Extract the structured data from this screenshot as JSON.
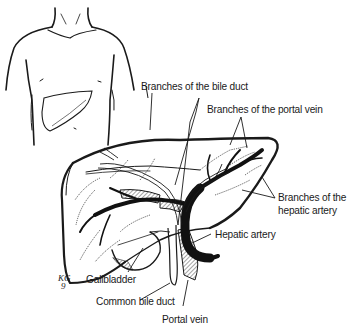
{
  "diagram": {
    "colors": {
      "ink": "#1a1a1a",
      "background": "#ffffff"
    },
    "labels": {
      "bile_duct_branches": "Branches of the bile duct",
      "portal_vein_branches": "Branches of the portal vein",
      "hepatic_artery_branches_line1": "Branches of the",
      "hepatic_artery_branches_line2": "hepatic artery",
      "hepatic_artery": "Hepatic artery",
      "gallbladder": "Gallbladder",
      "common_bile_duct": "Common bile duct",
      "portal_vein": "Portal vein"
    },
    "artist_signature": {
      "line1": "KG",
      "line2": "9"
    },
    "insets": {
      "torso": "Torso outline with liver location"
    }
  }
}
